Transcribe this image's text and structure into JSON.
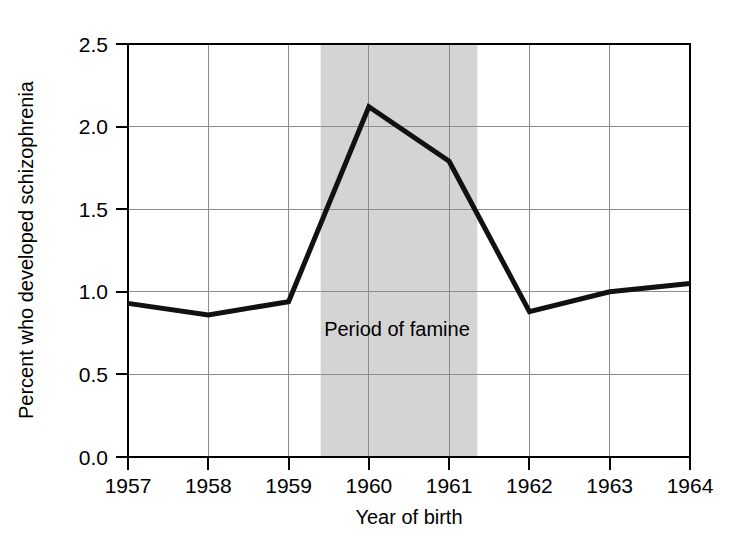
{
  "chart_data": {
    "type": "line",
    "title": "",
    "subtitle": "",
    "xlabel": "Year of birth",
    "ylabel": "Percent who developed schizophrenia",
    "x": [
      1957,
      1958,
      1959,
      1960,
      1961,
      1962,
      1963,
      1964
    ],
    "xticklabels": [
      "1957",
      "1958",
      "1959",
      "1960",
      "1961",
      "1962",
      "1963",
      "1964"
    ],
    "yticklabels": [
      "0.0",
      "0.5",
      "1.0",
      "1.5",
      "2.0",
      "2.5"
    ],
    "yticks": [
      0.0,
      0.5,
      1.0,
      1.5,
      2.0,
      2.5
    ],
    "xlim": [
      1957,
      1964
    ],
    "ylim": [
      0.0,
      2.5
    ],
    "grid": true,
    "legend": "none",
    "series": [
      {
        "name": "Percent who developed schizophrenia",
        "color": "#111111",
        "values": [
          0.93,
          0.86,
          0.94,
          2.12,
          1.79,
          0.88,
          1.0,
          1.05
        ]
      }
    ],
    "annotations": [
      {
        "name": "famine-band",
        "kind": "vspan",
        "label": "Period of famine",
        "x_start": 1959.4,
        "x_end": 1961.35,
        "color": "#d4d4d4",
        "label_x": 1960.35,
        "label_y": 0.73
      }
    ]
  }
}
